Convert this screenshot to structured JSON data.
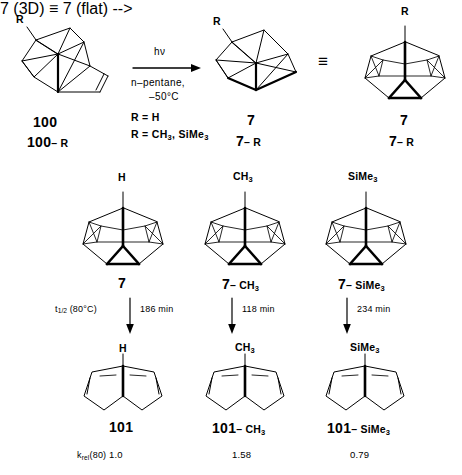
{
  "scheme": {
    "title": "Photochemical rearrangement of 100 to 7 and thermal retro reaction to 101",
    "reaction": {
      "reagent_above": "hν",
      "solvent": "n–pentane,",
      "temperature": "–50°C",
      "substituent_line_1": "R = H",
      "substituent_line_2_prefix": "R = CH",
      "substituent_line_2_mid": ", SiMe",
      "equivalence_symbol": "≡"
    },
    "row1": [
      {
        "name": "starting-material-100",
        "label_top": "100",
        "label_bottom_bold": "100",
        "label_bottom_rest": "– R",
        "r_group": "R"
      },
      {
        "name": "product-7-3d",
        "label_top": "7",
        "label_bottom_bold": "7",
        "label_bottom_rest": "– R",
        "r_group": "R"
      },
      {
        "name": "product-7-flat",
        "label_top": "7",
        "label_bottom_bold": "7",
        "label_bottom_rest": "– R",
        "r_group": "R"
      }
    ],
    "row2": [
      {
        "name": "cage-7-h",
        "apex": "H",
        "label_bold": "7",
        "label_rest": ""
      },
      {
        "name": "cage-7-ch3",
        "apex": "CH3",
        "label_bold": "7",
        "label_rest": "– CH3"
      },
      {
        "name": "cage-7-sime3",
        "apex": "SiMe3",
        "label_bold": "7",
        "label_rest": "– SiMe3"
      }
    ],
    "arrows": [
      {
        "name": "arrow-halflife-h",
        "prefix": "t",
        "prefix_frac": "1/2",
        "condition": "(80°C)",
        "value": "186 min"
      },
      {
        "name": "arrow-halflife-ch3",
        "prefix": "",
        "prefix_frac": "",
        "condition": "",
        "value": "118 min"
      },
      {
        "name": "arrow-halflife-sime3",
        "prefix": "",
        "prefix_frac": "",
        "condition": "",
        "value": "234 min"
      }
    ],
    "row3": [
      {
        "name": "diene-101-h",
        "apex": "H",
        "label_bold": "101",
        "label_rest": ""
      },
      {
        "name": "diene-101-ch3",
        "apex": "CH3",
        "label_bold": "101",
        "label_rest": "– CH3"
      },
      {
        "name": "diene-101-sime3",
        "apex": "SiMe3",
        "label_bold": "101",
        "label_rest": "– SiMe3"
      }
    ],
    "kinetics": {
      "label_base": "k",
      "label_sub": "rel",
      "label_paren": "(80)",
      "values": [
        "1.0",
        "1.58",
        "0.79"
      ]
    },
    "colors": {
      "ink": "#000000",
      "background": "#ffffff"
    }
  }
}
